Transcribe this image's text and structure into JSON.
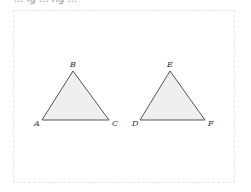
{
  "header": {
    "clipped_text": "... ig ... ng ..."
  },
  "diagram": {
    "fill_color": "#efefef",
    "stroke_color": "#555555",
    "triangles": [
      {
        "name": "ABC",
        "vertices": [
          {
            "label": "A",
            "x": 42,
            "y": 120
          },
          {
            "label": "B",
            "x": 73,
            "y": 71
          },
          {
            "label": "C",
            "x": 109,
            "y": 120
          }
        ]
      },
      {
        "name": "DEF",
        "vertices": [
          {
            "label": "D",
            "x": 140,
            "y": 120
          },
          {
            "label": "E",
            "x": 170,
            "y": 71
          },
          {
            "label": "F",
            "x": 205,
            "y": 120
          }
        ]
      }
    ]
  }
}
